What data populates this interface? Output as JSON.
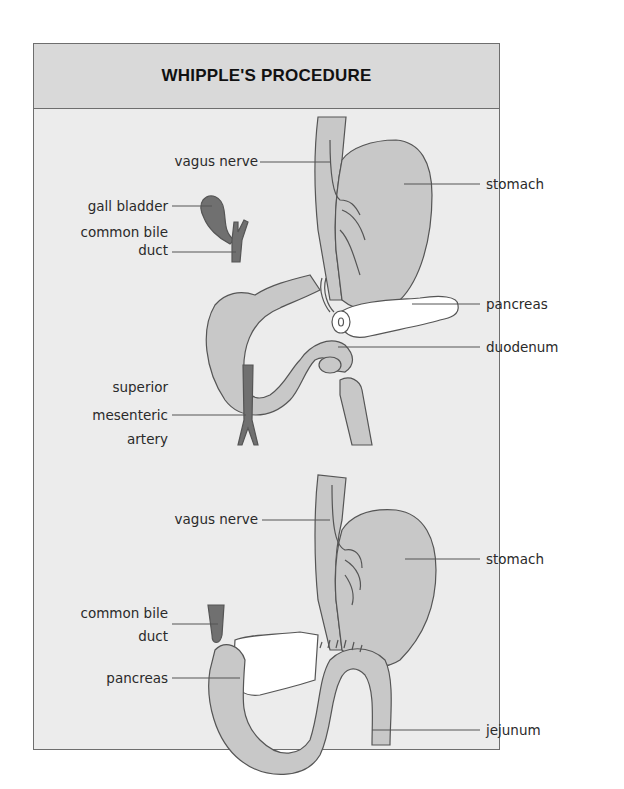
{
  "title": "WHIPPLE'S PROCEDURE",
  "colors": {
    "panel_bg": "#ececec",
    "header_bg": "#d9d9d9",
    "border": "#6e6e6e",
    "organ_fill": "#c8c8c8",
    "dark_fill": "#707070",
    "pancreas_fill": "#ffffff",
    "line": "#555555"
  },
  "top_diagram": {
    "labels": {
      "vagus_nerve": "vagus nerve",
      "stomach": "stomach",
      "gall_bladder": "gall bladder",
      "common_bile_duct_1": "common bile",
      "common_bile_duct_2": "duct",
      "pancreas": "pancreas",
      "duodenum": "duodenum",
      "sma_1": "superior",
      "sma_2": "mesenteric",
      "sma_3": "artery"
    }
  },
  "bottom_diagram": {
    "labels": {
      "vagus_nerve": "vagus nerve",
      "stomach": "stomach",
      "common_bile_duct_1": "common bile",
      "common_bile_duct_2": "duct",
      "pancreas": "pancreas",
      "jejunum": "jejunum"
    }
  }
}
